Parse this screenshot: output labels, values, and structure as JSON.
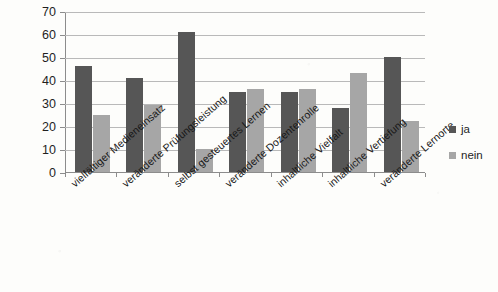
{
  "chart_data": {
    "type": "bar",
    "title": "",
    "subtitle": "",
    "xlabel": "",
    "ylabel": "",
    "ylim": [
      0,
      70
    ],
    "ytick_step": 10,
    "yticks": [
      0,
      10,
      20,
      30,
      40,
      50,
      60,
      70
    ],
    "grid": true,
    "grid_axis": "y",
    "legend_position": "right",
    "categories": [
      "vielfältiger Medieneinsatz",
      "veränderte Prüfungsleistung",
      "selbst gesteuertes Lernen",
      "veränderte Dozentenrolle",
      "inhaltliche Vielfalt",
      "inhaltliche Vertiefung",
      "veränderte Lernorte"
    ],
    "series": [
      {
        "name": "ja",
        "color": "#565656",
        "values": [
          46,
          41,
          61,
          35,
          35,
          28,
          50
        ]
      },
      {
        "name": "nein",
        "color": "#a6a6a6",
        "values": [
          25,
          29,
          10,
          36,
          36,
          43,
          22
        ]
      }
    ]
  },
  "legend": {
    "items": [
      {
        "label": "ja",
        "color": "#565656",
        "swatch_icon": "square-swatch-icon"
      },
      {
        "label": "nein",
        "color": "#a6a6a6",
        "swatch_icon": "square-swatch-icon"
      }
    ]
  },
  "colors": {
    "series_ja": "#565656",
    "series_nein": "#a6a6a6",
    "gridline": "#b9b9b9",
    "axis": "#8c8c8c",
    "background": "#fdfdfb",
    "text": "#1d1d1d"
  }
}
